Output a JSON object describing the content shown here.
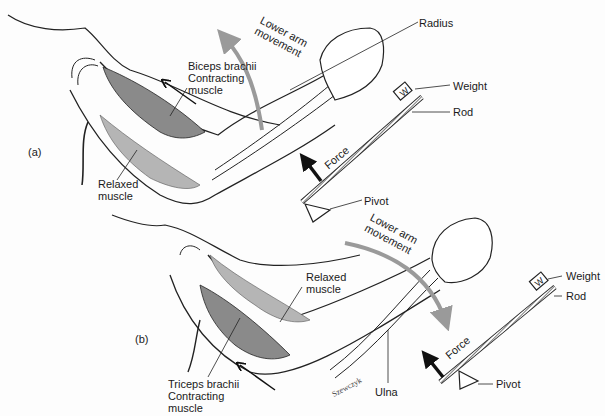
{
  "figure": {
    "panels": [
      {
        "id": "a",
        "tag": "(a)",
        "labels": {
          "movement_line1": "Lower arm",
          "movement_line2": "movement",
          "contracting_name": "Biceps brachii",
          "contracting_line2": "Contracting",
          "contracting_line3": "muscle",
          "relaxed_line1": "Relaxed",
          "relaxed_line2": "muscle",
          "bone": "Radius",
          "weight": "Weight",
          "weight_symbol": "W",
          "rod": "Rod",
          "force": "Force",
          "pivot": "Pivot"
        }
      },
      {
        "id": "b",
        "tag": "(b)",
        "labels": {
          "movement_line1": "Lower arm",
          "movement_line2": "movement",
          "contracting_name": "Triceps brachii",
          "contracting_line2": "Contracting",
          "contracting_line3": "muscle",
          "relaxed_line1": "Relaxed",
          "relaxed_line2": "muscle",
          "bone": "Ulna",
          "weight": "Weight",
          "weight_symbol": "W",
          "rod": "Rod",
          "force": "Force",
          "pivot": "Pivot"
        }
      }
    ],
    "signature": "Szewczyk",
    "colors": {
      "ink": "#1a1a1a",
      "contracting_muscle": "#8a8a8a",
      "relaxed_muscle": "#b5b5b5",
      "movement_arrow": "#9a9a9a"
    }
  }
}
